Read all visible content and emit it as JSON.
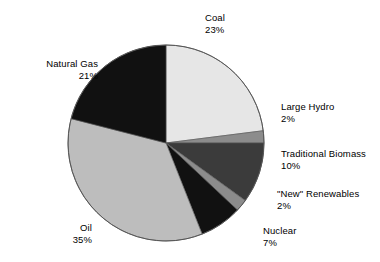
{
  "chart_data": {
    "type": "pie",
    "title": "",
    "subtitle": "",
    "xlabel": "",
    "ylabel": "",
    "legend_position": "none",
    "grid": false,
    "labels_show_percent": true,
    "start_angle_deg": 0,
    "direction": "clockwise",
    "categories": [
      "Coal",
      "Large Hydro",
      "Traditional Biomass",
      "\"New\" Renewables",
      "Nuclear",
      "Oil",
      "Natural Gas"
    ],
    "values": [
      23,
      2,
      10,
      2,
      7,
      35,
      21
    ],
    "value_unit": "%",
    "slices": [
      {
        "label": "Coal",
        "percent_text": "23%",
        "value": 23,
        "color": "#e6e6e6"
      },
      {
        "label": "Large Hydro",
        "percent_text": "2%",
        "value": 2,
        "color": "#8c8c8c"
      },
      {
        "label": "Traditional Biomass",
        "percent_text": "10%",
        "value": 10,
        "color": "#3b3b3b"
      },
      {
        "label": "\"New\" Renewables",
        "percent_text": "2%",
        "value": 2,
        "color": "#8c8c8c"
      },
      {
        "label": "Nuclear",
        "percent_text": "7%",
        "value": 7,
        "color": "#111111"
      },
      {
        "label": "Oil",
        "percent_text": "35%",
        "value": 35,
        "color": "#bdbdbd"
      },
      {
        "label": "Natural Gas",
        "percent_text": "21%",
        "value": 21,
        "color": "#111111"
      }
    ]
  },
  "labels": {
    "coal": {
      "name": "Coal",
      "pct": "23%"
    },
    "natural_gas": {
      "name": "Natural Gas",
      "pct": "21%"
    },
    "large_hydro": {
      "name": "Large Hydro",
      "pct": "2%"
    },
    "biomass": {
      "name": "Traditional Biomass",
      "pct": "10%"
    },
    "new_renew": {
      "name": "\"New\" Renewables",
      "pct": "2%"
    },
    "nuclear": {
      "name": "Nuclear",
      "pct": "7%"
    },
    "oil": {
      "name": "Oil",
      "pct": "35%"
    }
  },
  "style": {
    "background": "#ffffff",
    "outline": "#555555",
    "text": "#000000"
  }
}
